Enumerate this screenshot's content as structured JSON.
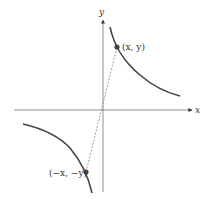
{
  "diagram": {
    "title": "",
    "x_axis_label": "x",
    "y_axis_label": "y",
    "point_labels": {
      "p1": "(x, y)",
      "p2": "(−x, −y)"
    },
    "colors": {
      "axis": "#777777",
      "curve": "#444444",
      "point": "#444444",
      "dashed": "#777777"
    }
  }
}
